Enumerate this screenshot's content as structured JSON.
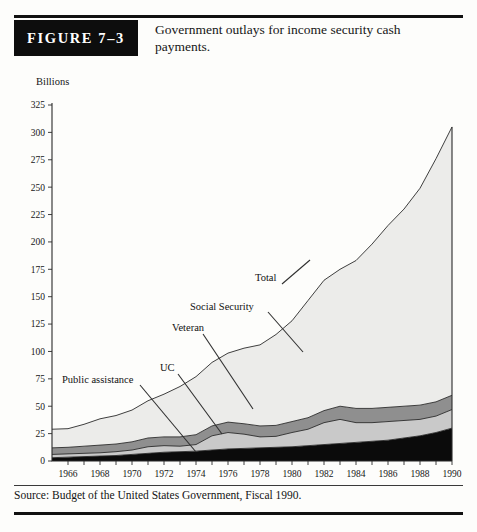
{
  "figure": {
    "badge": "FIGURE 7–3",
    "caption": "Government outlays for income security cash payments."
  },
  "source": "Source: Budget of the United States Government, Fiscal 1990.",
  "axes": {
    "y_title": "Billions",
    "y_ticks": [
      "0",
      "25",
      "50",
      "75",
      "100",
      "125",
      "150",
      "175",
      "200",
      "225",
      "250",
      "275",
      "300",
      "325"
    ],
    "x_ticks": [
      "1966",
      "1968",
      "1970",
      "1972",
      "1974",
      "1976",
      "1978",
      "1980",
      "1982",
      "1984",
      "1986",
      "1988",
      "1990"
    ]
  },
  "annotations": [
    {
      "label": "Public assistance"
    },
    {
      "label": "UC"
    },
    {
      "label": "Veteran"
    },
    {
      "label": "Social Security"
    },
    {
      "label": "Total"
    }
  ],
  "colors": {
    "band_public_assistance": "#0b0b0b",
    "band_uc": "#c9c9c9",
    "band_veteran": "#8f8f8f",
    "band_social_security": "#ececea",
    "outline": "#2a2a2a",
    "badge_bg": "#0d0d0d"
  },
  "chart_data": {
    "type": "area",
    "title": "Government outlays for income security cash payments.",
    "xlabel": "",
    "ylabel": "Billions",
    "xlim": [
      1965,
      1990
    ],
    "ylim": [
      0,
      325
    ],
    "grid": false,
    "legend": "inline-annotations",
    "stacked": true,
    "x": [
      1965,
      1966,
      1967,
      1968,
      1969,
      1970,
      1971,
      1972,
      1973,
      1974,
      1975,
      1976,
      1977,
      1978,
      1979,
      1980,
      1981,
      1982,
      1983,
      1984,
      1985,
      1986,
      1987,
      1988,
      1989,
      1990
    ],
    "series": [
      {
        "name": "Public assistance",
        "values": [
          3,
          3.5,
          4,
          4.5,
          5,
          6,
          7,
          8,
          8.5,
          9,
          10,
          11,
          11.5,
          12,
          12.5,
          13,
          14,
          15,
          16,
          17,
          18,
          19,
          21,
          23,
          26,
          30
        ]
      },
      {
        "name": "UC",
        "values": [
          3,
          3,
          3,
          3,
          3.5,
          4,
          6,
          6,
          5,
          6,
          13,
          15,
          13,
          10,
          10,
          13,
          15,
          20,
          22,
          18,
          17,
          17,
          16,
          15,
          15,
          17
        ]
      },
      {
        "name": "Veteran",
        "values": [
          6,
          6,
          6.5,
          7,
          7,
          7.5,
          8,
          8,
          8.5,
          9,
          9,
          9.5,
          9.5,
          10,
          10,
          10,
          10.5,
          11,
          12,
          13,
          13,
          13,
          13,
          13,
          13,
          13
        ]
      },
      {
        "name": "Social Security",
        "values": [
          17,
          17,
          20,
          24,
          26,
          29,
          34,
          39,
          46,
          53,
          58,
          63,
          69,
          74,
          83,
          92,
          107,
          119,
          125,
          135,
          150,
          166,
          180,
          198,
          222,
          245
        ]
      }
    ],
    "totals": [
      29,
      30,
      34,
      39,
      42,
      47,
      55,
      61,
      68,
      77,
      90,
      99,
      103,
      106,
      116,
      128,
      147,
      165,
      175,
      183,
      198,
      215,
      230,
      249,
      276,
      305
    ],
    "annotations": [
      {
        "text": "Public assistance",
        "points_to_series": "Public assistance"
      },
      {
        "text": "UC",
        "points_to_series": "UC"
      },
      {
        "text": "Veteran",
        "points_to_series": "Veteran"
      },
      {
        "text": "Social Security",
        "points_to_series": "Social Security"
      },
      {
        "text": "Total",
        "points_to_series": "Total"
      }
    ]
  }
}
